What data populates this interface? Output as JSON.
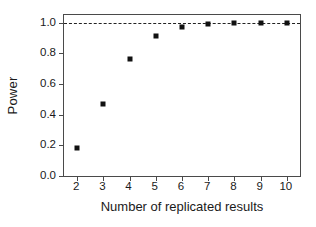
{
  "chart_data": {
    "type": "scatter",
    "title": "",
    "xlabel": "Number of replicated results",
    "ylabel": "Power",
    "x": [
      2,
      3,
      4,
      5,
      6,
      7,
      8,
      9,
      10
    ],
    "values": [
      0.18,
      0.47,
      0.76,
      0.91,
      0.97,
      0.99,
      1.0,
      1.0,
      1.0
    ],
    "series": [
      {
        "name": "Power",
        "values": [
          0.18,
          0.47,
          0.76,
          0.91,
          0.97,
          0.99,
          1.0,
          1.0,
          1.0
        ]
      }
    ],
    "xlim": [
      1.5,
      10.5
    ],
    "ylim": [
      0.0,
      1.05
    ],
    "xticks": [
      2,
      3,
      4,
      5,
      6,
      7,
      8,
      9,
      10
    ],
    "xtick_labels": [
      "2",
      "3",
      "4",
      "5",
      "6",
      "7",
      "8",
      "9",
      "10"
    ],
    "yticks": [
      0.0,
      0.2,
      0.4,
      0.6,
      0.8,
      1.0
    ],
    "ytick_labels": [
      "0.0",
      "0.2",
      "0.4",
      "0.6",
      "0.8",
      "1.0"
    ],
    "grid": false,
    "legend": null,
    "annotations": [
      {
        "name": "reference-line",
        "type": "hline",
        "y": 1.0,
        "style": "dashed",
        "color": "#222222"
      }
    ],
    "marker": {
      "shape": "square",
      "color": "#111111",
      "size": 5
    },
    "colors": {
      "axis": "#4a4a4a",
      "text": "#1a1a1a",
      "marker": "#111111",
      "refline": "#222222",
      "background": "#ffffff"
    }
  }
}
